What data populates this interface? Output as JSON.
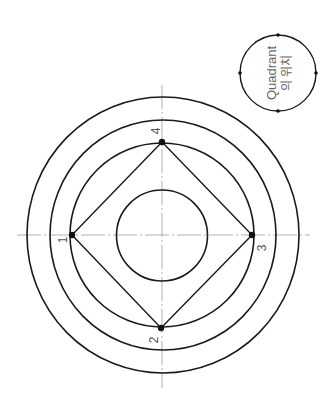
{
  "drawing": {
    "title": "Quadrant positions on concentric circles",
    "vertices": [
      {
        "id": "1",
        "label": "1",
        "position": "left"
      },
      {
        "id": "2",
        "label": "2",
        "position": "bottom"
      },
      {
        "id": "3",
        "label": "3",
        "position": "right"
      },
      {
        "id": "4",
        "label": "4",
        "position": "top"
      }
    ],
    "ring_count": 4,
    "colors": {
      "line": "#1a1a1a",
      "centerline": "#a8a8a8",
      "label": "#555555"
    }
  },
  "legend": {
    "line1": "Quadrant",
    "line2": "의 위치"
  }
}
